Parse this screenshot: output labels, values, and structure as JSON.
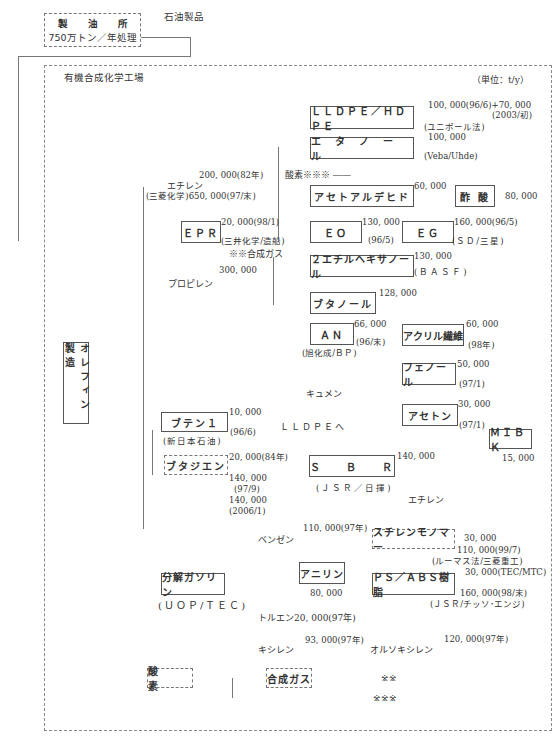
{
  "refinery": {
    "line1": "製　　油　　所",
    "line2": "750万トン／年処理",
    "out_label": "石油製品"
  },
  "plant": {
    "title": "有機合成化学工場",
    "unit": "（単位：t/y）"
  },
  "olefin_box": "オレフィン製造",
  "feed": {
    "ethylene": {
      "label": "エチレン",
      "cap1": "200, 000(82年)",
      "cap2": "(三菱化学)650, 000(97/末)"
    },
    "propylene": {
      "label": "プロピレン",
      "cap": "300, 000"
    },
    "oxygen_ref": "酸素※※※ ――",
    "syngas_ref": "※※合成ガス",
    "cumene": "キュメン",
    "to_lldpe": "ＬＬＤＰＥへ",
    "ethylene2": "エチレン",
    "benzene": {
      "label": "ベンゼン",
      "cap": "110, 000(97年)"
    },
    "toluene": "トルエン20, 000(97年)",
    "xylene": {
      "label": "キシレン",
      "cap": "93, 000(97年)"
    },
    "oxylene": {
      "label": "オルソキシレン",
      "cap": "120, 000(97年)"
    }
  },
  "products": {
    "lldpe": {
      "label": "ＬＬＤＰＥ／ＨＤＰＥ",
      "cap1": "100, 000(96/6)+70, 000",
      "cap2": "(2003/初)",
      "note": "(ユニポール法)"
    },
    "ethanol": {
      "label": "エ　タ　ノ　ー　ル",
      "cap": "100, 000",
      "note": "(Veba/Uhde)"
    },
    "acetaldehyde": {
      "label": "アセトアルデヒド",
      "cap": "60, 000"
    },
    "acetic_acid": {
      "label": "酢 酸",
      "cap": "80, 000"
    },
    "epr": {
      "label": "ＥＰＲ",
      "cap": "20, 000(98/1)",
      "note": "(三井化学/造船)"
    },
    "eo": {
      "label": "ＥＯ",
      "cap": "130, 000",
      "date": "(96/5)"
    },
    "eg": {
      "label": "ＥＧ",
      "cap": "160, 000(96/5)",
      "note": "(ＳＤ/三星)"
    },
    "ethylhexanol": {
      "label": "２エチルヘキサノール",
      "cap": "130, 000",
      "note": "(ＢＡＳＦ)"
    },
    "butanol": {
      "label": "ブタノール",
      "cap": "128, 000"
    },
    "an": {
      "label": "ＡＮ",
      "cap": "66, 000",
      "date": "(96/末)",
      "note": "(旭化成/ＢＰ)"
    },
    "acrylic": {
      "label": "アクリル繊維",
      "cap": "60, 000",
      "date": "(98年)"
    },
    "phenol": {
      "label": "フェノール",
      "cap": "50, 000",
      "date": "(97/1)"
    },
    "acetone": {
      "label": "アセトン",
      "cap": "30, 000",
      "date": "(97/1)"
    },
    "mibk": {
      "label": "ＭＩＢＫ",
      "cap": "15, 000"
    },
    "butene": {
      "label": "ブテン１",
      "cap": "10, 000",
      "date": "(96/6)",
      "note": "(新日本石油)"
    },
    "butadiene": {
      "label": "ブタジエン",
      "cap1": "20, 000(84年)",
      "cap2": "140, 000",
      "date2": "(97/9)",
      "cap3": "140, 000",
      "date3": "(2006/1)"
    },
    "sbr": {
      "label": "Ｓ　　Ｂ　　Ｒ",
      "cap": "140, 000",
      "note": "(ＪＳＲ／日揮)"
    },
    "styrene": {
      "label": "スチレンモノマー",
      "cap1": "30, 000",
      "cap2": "110, 000(99/7)",
      "note": "(ルーマス法/三菱重工)"
    },
    "aniline": {
      "label": "アニリン",
      "cap": "80, 000"
    },
    "psabs": {
      "label": "ＰＳ／ＡＢＳ樹脂",
      "cap1": "30, 000(TEC/MTC)",
      "cap2": "160, 000(98/末)",
      "note": "(ＪＳＲ/チッソ･エンジ)"
    },
    "cracked_gasoline": {
      "label": "分解ガソリン",
      "note": "(ＵＯＰ/ＴＥＣ)"
    },
    "oxygen": {
      "label": "酸　　素"
    },
    "syngas": {
      "label": "合成ガス"
    }
  },
  "footnotes": {
    "a": "※※",
    "b": "※※※"
  }
}
